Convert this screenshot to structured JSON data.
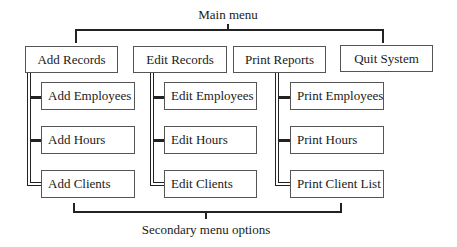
{
  "title": "Main menu",
  "footer_label": "Secondary menu options",
  "main_menu": [
    {
      "label": "Add Records",
      "children": [
        "Add Employees",
        "Add Hours",
        "Add Clients"
      ]
    },
    {
      "label": "Edit Records",
      "children": [
        "Edit Employees",
        "Edit Hours",
        "Edit Clients"
      ]
    },
    {
      "label": "Print Reports",
      "children": [
        "Print Employees",
        "Print Hours",
        "Print Client List"
      ]
    },
    {
      "label": "Quit System",
      "children": []
    }
  ]
}
